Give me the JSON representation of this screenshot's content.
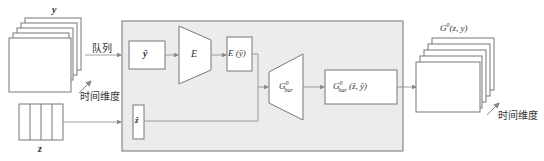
{
  "diagram": {
    "input_y": {
      "label": "y"
    },
    "input_z": {
      "label": "z"
    },
    "queue_label": "队列",
    "time_dim_label_left": "时间维度",
    "time_dim_label_right": "时间维度",
    "yhat_box": {
      "label": "ŷ"
    },
    "zhat_box": {
      "label": "ẑ"
    },
    "encoder": {
      "label": "E"
    },
    "encoded_box": {
      "label": "E (ŷ)"
    },
    "generator": {
      "label_main": "G",
      "label_sup": "0",
      "label_sub": "bar"
    },
    "gen_output_box": {
      "label_main": "G",
      "label_sup": "0",
      "label_sub": "bar",
      "label_args": " (ẑ, ŷ)"
    },
    "output": {
      "label_main": "G",
      "label_sup": "0",
      "label_args": "(z, y)"
    }
  },
  "colors": {
    "panel_fill": "#ececec",
    "panel_stroke": "#8a8a8a",
    "box_stroke": "#777777",
    "arrow": "#888888"
  }
}
